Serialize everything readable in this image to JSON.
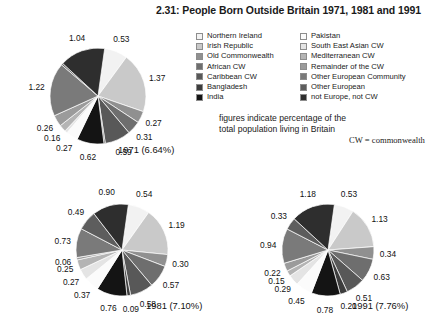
{
  "title": "2.31: People Born Outside Britain 1971, 1981 and 1991",
  "note": {
    "line1": "figures indicate percentage of the",
    "line2": "total population living in Britain",
    "cw": "CW = commonwealth"
  },
  "legend": {
    "left": [
      {
        "label": "Northern Ireland",
        "color": "#f2f2f2"
      },
      {
        "label": "Irish Republic",
        "color": "#c9c9c9"
      },
      {
        "label": "Old Commonwealth",
        "color": "#909090"
      },
      {
        "label": "African CW",
        "color": "#6e6e6e"
      },
      {
        "label": "Caribbean CW",
        "color": "#585858"
      },
      {
        "label": "Bangladesh",
        "color": "#3d3d3d"
      },
      {
        "label": "India",
        "color": "#141414"
      }
    ],
    "right": [
      {
        "label": "Pakistan",
        "color": "#fbfbfb"
      },
      {
        "label": "South East Asian CW",
        "color": "#e4e4e4"
      },
      {
        "label": "Mediterranean CW",
        "color": "#b4b4b4"
      },
      {
        "label": "Remainder of the CW",
        "color": "#9b9b9b"
      },
      {
        "label": "Other European Community",
        "color": "#7a7a7a"
      },
      {
        "label": "Other European",
        "color": "#5d5d5d"
      },
      {
        "label": "not Europe, not CW",
        "color": "#2e2e2e"
      }
    ]
  },
  "chart_data": [
    {
      "type": "pie",
      "title": "1971 (6.64%)",
      "year": "1971",
      "total_percent": "6.64%",
      "categories": [
        "Northern Ireland",
        "Irish Republic",
        "Old Commonwealth",
        "African CW",
        "Caribbean CW",
        "Bangladesh",
        "India",
        "Pakistan",
        "South East Asian CW",
        "Mediterranean CW",
        "Remainder of the CW",
        "Other European Community",
        "Other European",
        "not Europe, not CW"
      ],
      "values": [
        0.53,
        1.37,
        0.27,
        0.31,
        0.59,
        0.03,
        0.62,
        0.27,
        0.06,
        0.16,
        0.26,
        1.22,
        0.04,
        1.04
      ],
      "labels": [
        "0.53",
        "1.37",
        "0.27",
        "0.31",
        "0.59",
        "",
        "0.62",
        "0.27",
        "",
        "0.16",
        "0.26",
        "1.22",
        "",
        "1.04"
      ],
      "colors": [
        "#f2f2f2",
        "#c9c9c9",
        "#909090",
        "#6e6e6e",
        "#585858",
        "#3d3d3d",
        "#141414",
        "#fbfbfb",
        "#e4e4e4",
        "#b4b4b4",
        "#9b9b9b",
        "#7a7a7a",
        "#5d5d5d",
        "#2e2e2e"
      ],
      "unit": "percent of total population living in Britain"
    },
    {
      "type": "pie",
      "title": "1981 (7.10%)",
      "year": "1981",
      "total_percent": "7.10%",
      "categories": [
        "Northern Ireland",
        "Irish Republic",
        "Old Commonwealth",
        "African CW",
        "Caribbean CW",
        "Bangladesh",
        "India",
        "Pakistan",
        "South East Asian CW",
        "Mediterranean CW",
        "Remainder of the CW",
        "Other European Community",
        "Other European",
        "not Europe, not CW"
      ],
      "values": [
        0.54,
        1.19,
        0.3,
        0.57,
        0.58,
        0.09,
        0.76,
        0.37,
        0.27,
        0.25,
        0.06,
        0.73,
        0.49,
        0.9
      ],
      "labels": [
        "0.54",
        "1.19",
        "0.30",
        "0.57",
        "0.58",
        "0.09",
        "0.76",
        "0.37",
        "0.27",
        "0.25",
        "0.06",
        "0.73",
        "0.49",
        "0.90"
      ],
      "colors": [
        "#f2f2f2",
        "#c9c9c9",
        "#909090",
        "#6e6e6e",
        "#585858",
        "#3d3d3d",
        "#141414",
        "#fbfbfb",
        "#e4e4e4",
        "#b4b4b4",
        "#9b9b9b",
        "#7a7a7a",
        "#5d5d5d",
        "#2e2e2e"
      ],
      "unit": "percent of total population living in Britain"
    },
    {
      "type": "pie",
      "title": "1991 (7.76%)",
      "year": "1991",
      "total_percent": "7.76%",
      "categories": [
        "Northern Ireland",
        "Irish Republic",
        "Old Commonwealth",
        "African CW",
        "Caribbean CW",
        "Bangladesh",
        "India",
        "Pakistan",
        "South East Asian CW",
        "Mediterranean CW",
        "Remainder of the CW",
        "Other European Community",
        "Other European",
        "not Europe, not CW"
      ],
      "values": [
        0.53,
        1.13,
        0.34,
        0.63,
        0.51,
        0.2,
        0.78,
        0.45,
        0.29,
        0.15,
        0.22,
        0.94,
        0.33,
        1.18
      ],
      "labels": [
        "0.53",
        "1.13",
        "0.34",
        "0.63",
        "0.51",
        "0.20",
        "0.78",
        "0.45",
        "0.29",
        "0.15",
        "0.22",
        "0.94",
        "0.33",
        "1.18"
      ],
      "colors": [
        "#f2f2f2",
        "#c9c9c9",
        "#909090",
        "#6e6e6e",
        "#585858",
        "#3d3d3d",
        "#141414",
        "#fbfbfb",
        "#e4e4e4",
        "#b4b4b4",
        "#9b9b9b",
        "#7a7a7a",
        "#5d5d5d",
        "#2e2e2e"
      ],
      "unit": "percent of total population living in Britain"
    }
  ]
}
